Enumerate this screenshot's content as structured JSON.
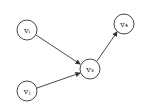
{
  "diagram": {
    "nodes": [
      {
        "id": "vi",
        "label": "vᵢ",
        "x": 27,
        "y": 30
      },
      {
        "id": "vj",
        "label": "vⱼ",
        "x": 27,
        "y": 91
      },
      {
        "id": "v3",
        "label": "v₃",
        "x": 90,
        "y": 69
      },
      {
        "id": "v4",
        "label": "v₄",
        "x": 124,
        "y": 24
      }
    ],
    "edges": [
      {
        "from": "vi",
        "to": "v3"
      },
      {
        "from": "vj",
        "to": "v3"
      },
      {
        "from": "v3",
        "to": "v4"
      }
    ],
    "node_radius": 10,
    "stroke_color": "#333333"
  }
}
